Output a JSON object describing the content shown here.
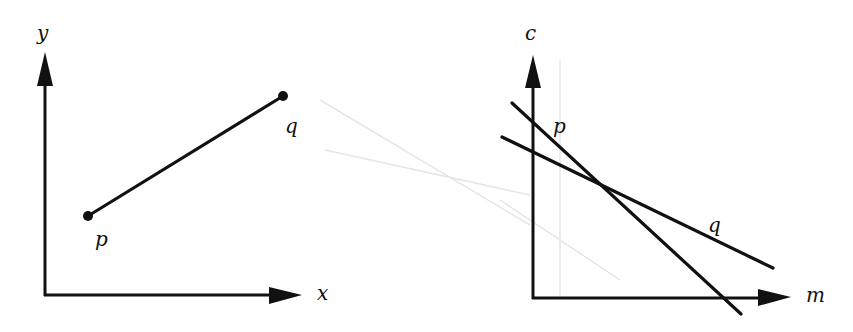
{
  "diagrams": [
    {
      "name": "data-space",
      "axes": {
        "x_label": "x",
        "y_label": "y"
      },
      "points": [
        {
          "label": "p",
          "x": 88,
          "y": 216
        },
        {
          "label": "q",
          "x": 283,
          "y": 96
        }
      ],
      "segment": {
        "from": "p",
        "to": "q"
      }
    },
    {
      "name": "parameter-space",
      "axes": {
        "x_label": "m",
        "y_label": "c"
      },
      "lines": [
        {
          "label": "p",
          "x1": 512,
          "y1": 103,
          "x2": 741,
          "y2": 314
        },
        {
          "label": "q",
          "x1": 502,
          "y1": 137,
          "x2": 773,
          "y2": 268
        }
      ]
    }
  ],
  "colors": {
    "ink": "#111111",
    "background": "#ffffff",
    "ghost": "#e6e6e6"
  }
}
